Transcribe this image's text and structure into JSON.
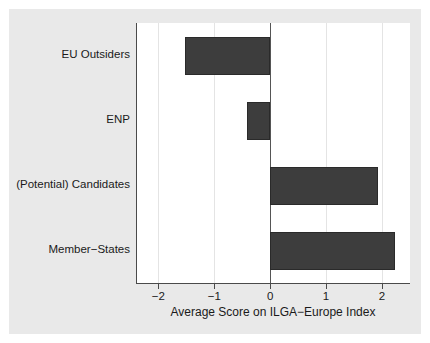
{
  "chart_data": {
    "type": "bar",
    "orientation": "horizontal",
    "title": "",
    "subtitle": "",
    "xlabel": "Average Score on ILGA−Europe Index",
    "ylabel": "",
    "categories": [
      "EU Outsiders",
      "ENP",
      "(Potential) Candidates",
      "Member−States"
    ],
    "values": [
      -1.53,
      -0.41,
      1.92,
      2.24
    ],
    "xlim": [
      -2.4,
      2.5
    ],
    "xticks": [
      -2,
      -1,
      0,
      1,
      2
    ],
    "xtick_labels": [
      "−2",
      "−1",
      "0",
      "1",
      "2"
    ],
    "grid": true,
    "grid_axis": "x",
    "legend": null,
    "bar_color": "#3d3d3d",
    "bar_edge_color": "#2a2a2a",
    "panel_color": "#e9e9e9",
    "plot_background": "#ffffff",
    "gridline_color": "#e4e4e4",
    "zero_line_color": "#555555",
    "axis_color": "#4a4a4a"
  }
}
